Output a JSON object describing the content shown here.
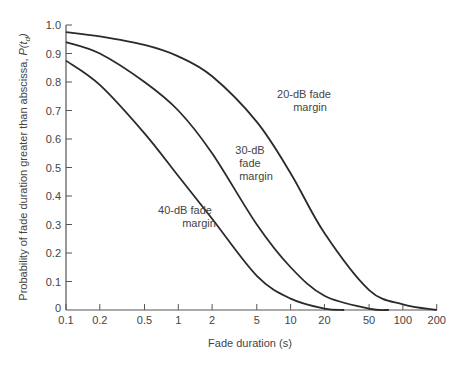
{
  "chart_data": {
    "type": "line",
    "title": "",
    "xlabel": "Fade duration (s)",
    "ylabel": "Probability of fade duration  greater than abscissa, P(t_d)",
    "xscale": "log",
    "xlim": [
      0.1,
      200
    ],
    "ylim": [
      0,
      1.0
    ],
    "grid": false,
    "legend": "inline annotations",
    "x_ticks": [
      0.1,
      0.2,
      0.5,
      1,
      2,
      5,
      10,
      20,
      50,
      100,
      200
    ],
    "x_tick_labels": [
      "0.1",
      "0.2",
      "0.5",
      "1",
      "2",
      "5",
      "10",
      "20",
      "50",
      "100",
      "200"
    ],
    "y_ticks": [
      0,
      0.1,
      0.2,
      0.3,
      0.4,
      0.5,
      0.6,
      0.7,
      0.8,
      0.9,
      1.0
    ],
    "y_tick_labels": [
      "0",
      "0.1",
      "0.2",
      "0.3",
      "0.4",
      "0.5",
      "0.6",
      "0.7",
      "0.8",
      "0.9",
      "1.0"
    ],
    "series": [
      {
        "name": "20-dB fade margin",
        "label_lines": [
          "20-dB fade",
          "margin"
        ],
        "x": [
          0.1,
          0.2,
          0.5,
          1,
          2,
          5,
          10,
          20,
          50,
          100,
          200
        ],
        "y": [
          0.975,
          0.96,
          0.93,
          0.89,
          0.82,
          0.66,
          0.48,
          0.27,
          0.07,
          0.02,
          0.0
        ]
      },
      {
        "name": "30-dB fade margin",
        "label_lines": [
          "30-dB",
          "fade",
          "margin"
        ],
        "x": [
          0.1,
          0.2,
          0.5,
          1,
          2,
          5,
          10,
          20,
          50,
          75
        ],
        "y": [
          0.94,
          0.9,
          0.8,
          0.7,
          0.55,
          0.3,
          0.15,
          0.05,
          0.005,
          0.0
        ]
      },
      {
        "name": "40-dB fade margin",
        "label_lines": [
          "40-dB fade",
          "margin"
        ],
        "x": [
          0.1,
          0.2,
          0.5,
          1,
          2,
          5,
          10,
          20,
          30
        ],
        "y": [
          0.875,
          0.79,
          0.62,
          0.47,
          0.32,
          0.12,
          0.04,
          0.005,
          0.0
        ]
      }
    ]
  }
}
